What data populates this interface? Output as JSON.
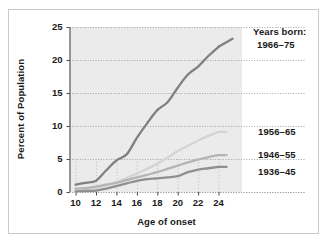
{
  "chart_data": {
    "type": "line",
    "title": "",
    "xlabel": "Age of onset",
    "ylabel": "Percent of Population",
    "xlim": [
      9.4,
      26.3
    ],
    "ylim": [
      0,
      25
    ],
    "xticks": [
      10,
      12,
      14,
      16,
      18,
      20,
      22,
      24
    ],
    "yticks": [
      0,
      5,
      10,
      15,
      20,
      25
    ],
    "grid": true,
    "grid_style": "dotted-horizontal",
    "legend_position": "inline-right-end-of-line",
    "legend_title": "Years born:",
    "plot_background": "#ebebeb",
    "series": [
      {
        "name": "1966–75",
        "label": "1966–75",
        "color": "#808080",
        "x": [
          10,
          11,
          12,
          13,
          14,
          15,
          16,
          17,
          18,
          19,
          20,
          21,
          22,
          23,
          24
        ],
        "values": [
          1.1,
          1.4,
          1.7,
          3.3,
          4.8,
          5.7,
          8.2,
          10.4,
          12.4,
          13.6,
          15.8,
          17.8,
          19.0,
          20.6,
          22.0
        ]
      },
      {
        "name": "1956–65",
        "label": "1956–65",
        "color": "#d4d4d4",
        "x": [
          10,
          11,
          12,
          13,
          14,
          15,
          16,
          17,
          18,
          19,
          20,
          21,
          22,
          23,
          24
        ],
        "values": [
          0.1,
          0.3,
          0.6,
          1.0,
          1.5,
          2.1,
          2.8,
          3.5,
          4.3,
          5.2,
          6.2,
          7.0,
          7.8,
          8.5,
          9.1
        ]
      },
      {
        "name": "1946–55",
        "label": "1946–55",
        "color": "#b4b4b4",
        "x": [
          10,
          11,
          12,
          13,
          14,
          15,
          16,
          17,
          18,
          19,
          20,
          21,
          22,
          23,
          24
        ],
        "values": [
          0.5,
          0.6,
          0.8,
          1.1,
          1.4,
          1.8,
          2.2,
          2.6,
          3.0,
          3.5,
          4.0,
          4.5,
          4.9,
          5.3,
          5.6
        ]
      },
      {
        "name": "1936–45",
        "label": "1936–45",
        "color": "#8f8f8f",
        "x": [
          10,
          11,
          12,
          13,
          14,
          15,
          16,
          17,
          18,
          19,
          20,
          21,
          22,
          23,
          24
        ],
        "values": [
          0.1,
          0.15,
          0.2,
          0.5,
          0.9,
          1.3,
          1.7,
          1.95,
          2.05,
          2.2,
          2.4,
          3.0,
          3.4,
          3.6,
          3.8
        ]
      }
    ],
    "xtick_labels": [
      "10",
      "12",
      "14",
      "16",
      "18",
      "20",
      "22",
      "24"
    ],
    "ytick_labels": [
      "0",
      "5",
      "10",
      "15",
      "20",
      "25"
    ]
  }
}
